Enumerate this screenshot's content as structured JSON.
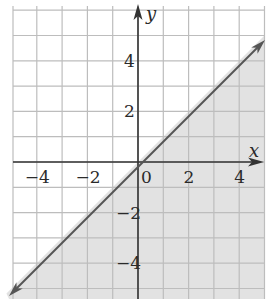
{
  "chart_data": {
    "type": "line",
    "title": "",
    "xlabel": "x",
    "ylabel": "y",
    "xlim": [
      -5,
      5
    ],
    "ylim": [
      -5.3,
      6.1
    ],
    "grid": true,
    "grid_step": 1,
    "x_ticks": [
      -4,
      -2,
      0,
      2,
      4
    ],
    "y_ticks": [
      -4,
      -2,
      2,
      4
    ],
    "x_tick_labels": [
      "−4",
      "−2",
      "0",
      "2",
      "4"
    ],
    "y_tick_labels": [
      "−4",
      "−2",
      "2",
      "4"
    ],
    "series": [
      {
        "name": "boundary line y = x",
        "style": "solid",
        "arrows": "both",
        "x": [
          -5.1,
          5.0
        ],
        "y": [
          -5.1,
          5.0
        ]
      }
    ],
    "shaded_region": {
      "description": "y <= x (region below/right of the line)",
      "color": "#e2e2e2"
    },
    "colors": {
      "grid": "#bdbdbd",
      "axes": "#333333",
      "line": "#555555",
      "shade": "#e2e2e2"
    }
  }
}
